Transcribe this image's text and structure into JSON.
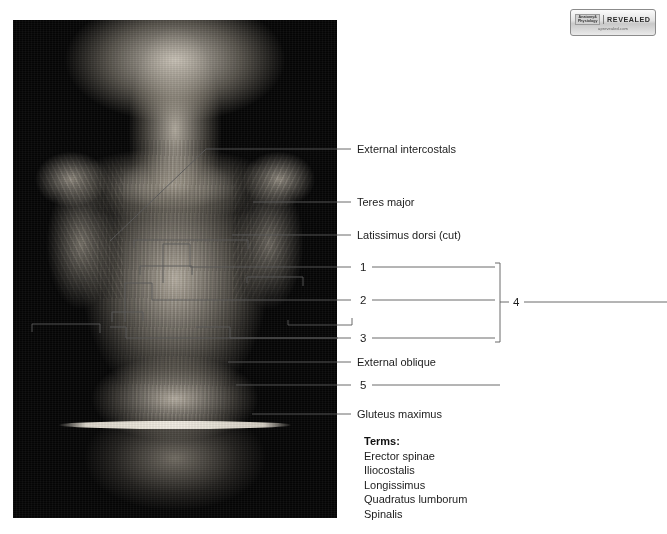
{
  "figure": {
    "photo_alt": "Posterior deep back dissection"
  },
  "brand": {
    "ap_line1": "Anatomy&",
    "ap_line2": "Physiology",
    "revealed": "REVEALED",
    "url": "aprevealed.com"
  },
  "labels": [
    {
      "id": "external-intercostals",
      "text": "External intercostals"
    },
    {
      "id": "teres-major",
      "text": "Teres major"
    },
    {
      "id": "latissimus-dorsi-cut",
      "text": "Latissimus dorsi (cut)"
    },
    {
      "id": "external-oblique",
      "text": "External oblique"
    },
    {
      "id": "gluteus-maximus",
      "text": "Gluteus maximus"
    }
  ],
  "numbered_labels": [
    {
      "id": "num-1",
      "text": "1"
    },
    {
      "id": "num-2",
      "text": "2"
    },
    {
      "id": "num-3",
      "text": "3"
    },
    {
      "id": "num-4",
      "text": "4"
    },
    {
      "id": "num-5",
      "text": "5"
    }
  ],
  "terms": {
    "heading": "Terms:",
    "items": [
      "Erector spinae",
      "Iliocostalis",
      "Longissimus",
      "Quadratus lumborum",
      "Spinalis"
    ]
  },
  "colors": {
    "background": "#ffffff",
    "leader_line": "#5a5a5a",
    "text": "#1c1c1c",
    "photo_background": "#060606"
  }
}
